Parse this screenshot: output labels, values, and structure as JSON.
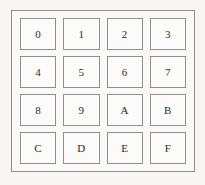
{
  "figure": {
    "name": "hex-keypad",
    "frame": {
      "border_color": "#8d8d8d",
      "fill_color": "#faf9f7"
    },
    "background_color": "#f7f6f3",
    "key_border_color": "#8f8f8f",
    "key_fill_color": "#fbfbf9",
    "label_color": "#2b2b2b"
  },
  "keypad": {
    "rows": 4,
    "columns": 4,
    "keys": [
      {
        "label": "0",
        "row": 1,
        "column": 1
      },
      {
        "label": "1",
        "row": 1,
        "column": 2
      },
      {
        "label": "2",
        "row": 1,
        "column": 3
      },
      {
        "label": "3",
        "row": 1,
        "column": 4
      },
      {
        "label": "4",
        "row": 2,
        "column": 1
      },
      {
        "label": "5",
        "row": 2,
        "column": 2
      },
      {
        "label": "6",
        "row": 2,
        "column": 3
      },
      {
        "label": "7",
        "row": 2,
        "column": 4
      },
      {
        "label": "8",
        "row": 3,
        "column": 1
      },
      {
        "label": "9",
        "row": 3,
        "column": 2
      },
      {
        "label": "A",
        "row": 3,
        "column": 3
      },
      {
        "label": "B",
        "row": 3,
        "column": 4
      },
      {
        "label": "C",
        "row": 4,
        "column": 1
      },
      {
        "label": "D",
        "row": 4,
        "column": 2
      },
      {
        "label": "E",
        "row": 4,
        "column": 3
      },
      {
        "label": "F",
        "row": 4,
        "column": 4
      }
    ]
  }
}
